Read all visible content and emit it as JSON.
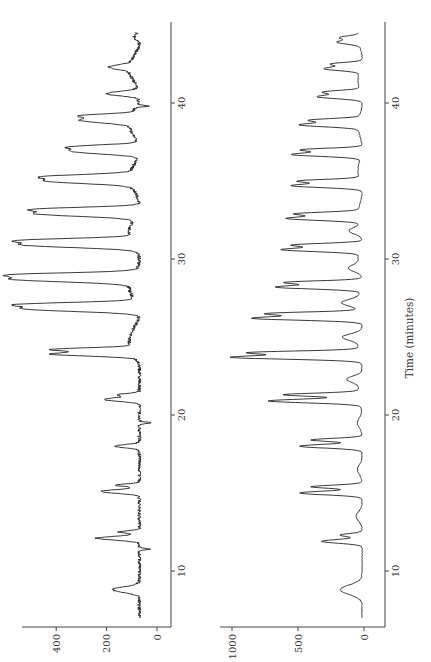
{
  "chart_data": [
    {
      "type": "line",
      "panel": "top",
      "title": "",
      "xlabel": "Time (minutes)",
      "ylabel": "",
      "xlim": [
        7,
        44.5
      ],
      "ylim": [
        0,
        530
      ],
      "x_ticks": [
        10,
        20,
        30,
        40
      ],
      "y_ticks": [
        0,
        200,
        400
      ],
      "baseline": 70,
      "orientation": "rotated-90 (time runs bottom-to-top, intensity increases leftward)",
      "peaks": [
        {
          "time": 8.8,
          "intensity": 175,
          "width": 0.18
        },
        {
          "time": 11.4,
          "intensity": 25,
          "width": 0.05
        },
        {
          "time": 12.1,
          "intensity": 240,
          "width": 0.12
        },
        {
          "time": 12.5,
          "intensity": 150,
          "width": 0.08
        },
        {
          "time": 15.1,
          "intensity": 225,
          "width": 0.12
        },
        {
          "time": 15.5,
          "intensity": 160,
          "width": 0.08
        },
        {
          "time": 18.0,
          "intensity": 170,
          "width": 0.1
        },
        {
          "time": 19.5,
          "intensity": 25,
          "width": 0.05
        },
        {
          "time": 21.0,
          "intensity": 210,
          "width": 0.12
        },
        {
          "time": 21.3,
          "intensity": 150,
          "width": 0.08
        },
        {
          "time": 23.9,
          "intensity": 400,
          "width": 0.12
        },
        {
          "time": 24.2,
          "intensity": 380,
          "width": 0.1
        },
        {
          "time": 26.8,
          "intensity": 510,
          "width": 0.16
        },
        {
          "time": 27.1,
          "intensity": 470,
          "width": 0.12
        },
        {
          "time": 28.7,
          "intensity": 530,
          "width": 0.16
        },
        {
          "time": 29.0,
          "intensity": 480,
          "width": 0.12
        },
        {
          "time": 30.9,
          "intensity": 500,
          "width": 0.16
        },
        {
          "time": 31.2,
          "intensity": 450,
          "width": 0.12
        },
        {
          "time": 32.9,
          "intensity": 460,
          "width": 0.16
        },
        {
          "time": 33.2,
          "intensity": 420,
          "width": 0.12
        },
        {
          "time": 35.0,
          "intensity": 395,
          "width": 0.16
        },
        {
          "time": 35.3,
          "intensity": 360,
          "width": 0.12
        },
        {
          "time": 36.9,
          "intensity": 335,
          "width": 0.16
        },
        {
          "time": 37.2,
          "intensity": 300,
          "width": 0.12
        },
        {
          "time": 38.9,
          "intensity": 270,
          "width": 0.16
        },
        {
          "time": 39.2,
          "intensity": 240,
          "width": 0.1
        },
        {
          "time": 39.8,
          "intensity": 20,
          "width": 0.05
        },
        {
          "time": 40.6,
          "intensity": 200,
          "width": 0.14
        },
        {
          "time": 42.3,
          "intensity": 150,
          "width": 0.14
        },
        {
          "time": 44.2,
          "intensity": 90,
          "width": 0.14
        }
      ]
    },
    {
      "type": "line",
      "panel": "bottom",
      "title": "",
      "xlabel": "Time (minutes)",
      "ylabel": "",
      "xlim": [
        7,
        44.5
      ],
      "ylim": [
        0,
        1000
      ],
      "x_ticks": [
        10,
        20,
        30,
        40
      ],
      "y_ticks": [
        0,
        500,
        1000
      ],
      "baseline": 15,
      "orientation": "rotated-90 (time runs bottom-to-top, intensity increases leftward)",
      "peaks": [
        {
          "time": 8.8,
          "intensity": 180,
          "width": 0.3
        },
        {
          "time": 11.9,
          "intensity": 320,
          "width": 0.12
        },
        {
          "time": 12.3,
          "intensity": 180,
          "width": 0.1
        },
        {
          "time": 13.5,
          "intensity": 60,
          "width": 0.3
        },
        {
          "time": 15.0,
          "intensity": 485,
          "width": 0.12
        },
        {
          "time": 15.4,
          "intensity": 400,
          "width": 0.1
        },
        {
          "time": 16.5,
          "intensity": 50,
          "width": 0.3
        },
        {
          "time": 18.0,
          "intensity": 485,
          "width": 0.12
        },
        {
          "time": 18.4,
          "intensity": 400,
          "width": 0.1
        },
        {
          "time": 19.5,
          "intensity": 50,
          "width": 0.3
        },
        {
          "time": 20.9,
          "intensity": 705,
          "width": 0.12
        },
        {
          "time": 21.3,
          "intensity": 580,
          "width": 0.1
        },
        {
          "time": 22.3,
          "intensity": 120,
          "width": 0.2
        },
        {
          "time": 23.7,
          "intensity": 985,
          "width": 0.12
        },
        {
          "time": 24.0,
          "intensity": 820,
          "width": 0.1
        },
        {
          "time": 25.0,
          "intensity": 150,
          "width": 0.2
        },
        {
          "time": 26.2,
          "intensity": 840,
          "width": 0.12
        },
        {
          "time": 26.5,
          "intensity": 700,
          "width": 0.1
        },
        {
          "time": 27.2,
          "intensity": 140,
          "width": 0.2
        },
        {
          "time": 28.2,
          "intensity": 660,
          "width": 0.12
        },
        {
          "time": 28.5,
          "intensity": 580,
          "width": 0.1
        },
        {
          "time": 29.4,
          "intensity": 100,
          "width": 0.2
        },
        {
          "time": 30.6,
          "intensity": 605,
          "width": 0.12
        },
        {
          "time": 30.9,
          "intensity": 520,
          "width": 0.1
        },
        {
          "time": 31.8,
          "intensity": 110,
          "width": 0.2
        },
        {
          "time": 32.6,
          "intensity": 560,
          "width": 0.12
        },
        {
          "time": 32.9,
          "intensity": 480,
          "width": 0.1
        },
        {
          "time": 34.7,
          "intensity": 540,
          "width": 0.12
        },
        {
          "time": 35.0,
          "intensity": 470,
          "width": 0.1
        },
        {
          "time": 36.7,
          "intensity": 540,
          "width": 0.12
        },
        {
          "time": 37.0,
          "intensity": 460,
          "width": 0.1
        },
        {
          "time": 38.6,
          "intensity": 460,
          "width": 0.12
        },
        {
          "time": 38.9,
          "intensity": 380,
          "width": 0.1
        },
        {
          "time": 40.4,
          "intensity": 350,
          "width": 0.12
        },
        {
          "time": 40.7,
          "intensity": 290,
          "width": 0.1
        },
        {
          "time": 42.2,
          "intensity": 290,
          "width": 0.12
        },
        {
          "time": 42.5,
          "intensity": 240,
          "width": 0.1
        },
        {
          "time": 43.9,
          "intensity": 180,
          "width": 0.12
        },
        {
          "time": 44.2,
          "intensity": 150,
          "width": 0.1
        }
      ]
    }
  ],
  "layout": {
    "time_axis_title": "Time (minutes)",
    "time_tick_labels": [
      "10",
      "20",
      "30",
      "40"
    ],
    "top_intensity_tick_labels": [
      "0",
      "200",
      "400"
    ],
    "bottom_intensity_tick_labels": [
      "0",
      "500",
      "1000"
    ]
  }
}
